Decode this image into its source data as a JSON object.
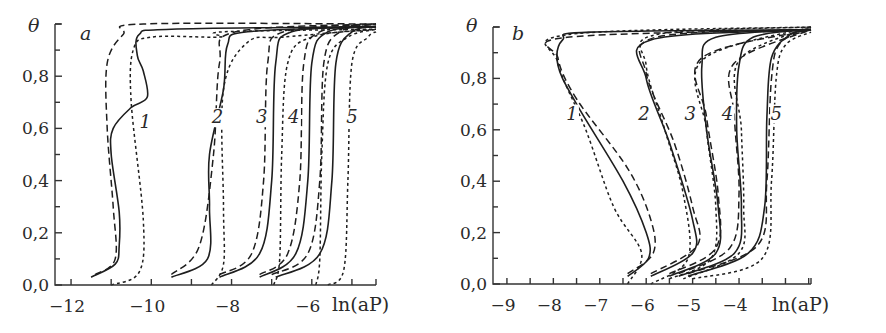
{
  "chart_data": [
    {
      "panel": "a",
      "type": "line",
      "title": "",
      "panel_label": "a",
      "xlabel": "ln(aP)",
      "ylabel": "θ",
      "xlim": [
        -12.4,
        -4.4
      ],
      "ylim": [
        0.0,
        1.0
      ],
      "x_ticks": [
        -12,
        -10,
        -8,
        -6
      ],
      "x_tick_labels": [
        "−12",
        "−10",
        "−8",
        "−6"
      ],
      "y_ticks": [
        0.0,
        0.2,
        0.4,
        0.6,
        0.8
      ],
      "y_tick_labels": [
        "0,0",
        "0,2",
        "0,4",
        "0,6",
        "0,8"
      ],
      "grid": false,
      "line_styles": [
        "solid",
        "dashed",
        "dotted"
      ],
      "curve_labels": [
        "1",
        "2",
        "3",
        "4",
        "5"
      ],
      "series": [
        {
          "curve": "1",
          "style": "solid",
          "points": [
            [
              -11.5,
              0.03
            ],
            [
              -10.9,
              0.08
            ],
            [
              -10.8,
              0.15
            ],
            [
              -10.8,
              0.28
            ],
            [
              -11.0,
              0.5
            ],
            [
              -10.95,
              0.6
            ],
            [
              -10.5,
              0.68
            ],
            [
              -10.1,
              0.72
            ],
            [
              -10.2,
              0.82
            ],
            [
              -10.35,
              0.88
            ],
            [
              -10.3,
              0.96
            ],
            [
              -9.5,
              0.98
            ],
            [
              -4.4,
              0.99
            ]
          ]
        },
        {
          "curve": "1",
          "style": "dashed",
          "points": [
            [
              -11.4,
              0.04
            ],
            [
              -10.9,
              0.1
            ],
            [
              -10.95,
              0.3
            ],
            [
              -11.1,
              0.6
            ],
            [
              -11.1,
              0.85
            ],
            [
              -10.7,
              0.96
            ],
            [
              -10.2,
              1.0
            ],
            [
              -4.4,
              1.0
            ]
          ]
        },
        {
          "curve": "1",
          "style": "dotted",
          "points": [
            [
              -11.0,
              0.0
            ],
            [
              -10.3,
              0.05
            ],
            [
              -10.2,
              0.25
            ],
            [
              -10.5,
              0.7
            ],
            [
              -10.45,
              0.9
            ],
            [
              -10.0,
              0.95
            ],
            [
              -8.3,
              0.95
            ],
            [
              -8.2,
              0.97
            ],
            [
              -4.4,
              0.98
            ]
          ]
        },
        {
          "curve": "2",
          "style": "solid",
          "points": [
            [
              -9.5,
              0.03
            ],
            [
              -8.6,
              0.1
            ],
            [
              -8.55,
              0.3
            ],
            [
              -8.55,
              0.5
            ],
            [
              -8.2,
              0.75
            ],
            [
              -8.1,
              0.92
            ],
            [
              -7.6,
              0.97
            ],
            [
              -4.4,
              0.99
            ]
          ]
        },
        {
          "curve": "2",
          "style": "dashed",
          "points": [
            [
              -9.5,
              0.04
            ],
            [
              -8.8,
              0.15
            ],
            [
              -8.45,
              0.5
            ],
            [
              -8.3,
              0.85
            ],
            [
              -7.9,
              0.97
            ],
            [
              -4.4,
              1.0
            ]
          ]
        },
        {
          "curve": "2",
          "style": "dotted",
          "points": [
            [
              -8.5,
              0.0
            ],
            [
              -8.2,
              0.08
            ],
            [
              -8.2,
              0.3
            ],
            [
              -8.2,
              0.75
            ],
            [
              -7.6,
              0.93
            ],
            [
              -6.7,
              0.95
            ],
            [
              -4.4,
              0.98
            ]
          ]
        },
        {
          "curve": "3",
          "style": "solid",
          "points": [
            [
              -8.3,
              0.03
            ],
            [
              -7.3,
              0.12
            ],
            [
              -7.0,
              0.4
            ],
            [
              -6.9,
              0.85
            ],
            [
              -6.5,
              0.97
            ],
            [
              -4.4,
              0.99
            ]
          ]
        },
        {
          "curve": "3",
          "style": "dashed",
          "points": [
            [
              -8.3,
              0.04
            ],
            [
              -7.5,
              0.12
            ],
            [
              -7.2,
              0.4
            ],
            [
              -7.1,
              0.85
            ],
            [
              -6.7,
              0.97
            ],
            [
              -4.4,
              1.0
            ]
          ]
        },
        {
          "curve": "3",
          "style": "dotted",
          "points": [
            [
              -6.95,
              0.0
            ],
            [
              -6.8,
              0.1
            ],
            [
              -6.75,
              0.5
            ],
            [
              -6.6,
              0.85
            ],
            [
              -6.0,
              0.95
            ],
            [
              -4.4,
              0.98
            ]
          ]
        },
        {
          "curve": "4",
          "style": "solid",
          "points": [
            [
              -7.3,
              0.03
            ],
            [
              -6.4,
              0.12
            ],
            [
              -6.1,
              0.4
            ],
            [
              -6.0,
              0.85
            ],
            [
              -5.6,
              0.97
            ],
            [
              -4.4,
              0.99
            ]
          ]
        },
        {
          "curve": "4",
          "style": "dashed",
          "points": [
            [
              -7.3,
              0.04
            ],
            [
              -6.6,
              0.12
            ],
            [
              -6.3,
              0.4
            ],
            [
              -6.2,
              0.85
            ],
            [
              -5.8,
              0.97
            ],
            [
              -4.4,
              1.0
            ]
          ]
        },
        {
          "curve": "4",
          "style": "dotted",
          "points": [
            [
              -5.9,
              0.0
            ],
            [
              -5.8,
              0.1
            ],
            [
              -5.75,
              0.5
            ],
            [
              -5.6,
              0.85
            ],
            [
              -5.1,
              0.95
            ],
            [
              -4.4,
              0.98
            ]
          ]
        },
        {
          "curve": "5",
          "style": "solid",
          "points": [
            [
              -6.9,
              0.03
            ],
            [
              -5.8,
              0.12
            ],
            [
              -5.5,
              0.4
            ],
            [
              -5.4,
              0.85
            ],
            [
              -5.0,
              0.97
            ],
            [
              -4.4,
              0.99
            ]
          ]
        },
        {
          "curve": "5",
          "style": "dashed",
          "points": [
            [
              -7.0,
              0.04
            ],
            [
              -6.1,
              0.12
            ],
            [
              -5.8,
              0.4
            ],
            [
              -5.7,
              0.85
            ],
            [
              -5.3,
              0.97
            ],
            [
              -4.4,
              1.0
            ]
          ]
        },
        {
          "curve": "5",
          "style": "dotted",
          "points": [
            [
              -5.6,
              0.0
            ],
            [
              -5.2,
              0.06
            ],
            [
              -5.1,
              0.4
            ],
            [
              -5.0,
              0.85
            ],
            [
              -4.6,
              0.95
            ],
            [
              -4.4,
              0.97
            ]
          ]
        }
      ]
    },
    {
      "panel": "b",
      "type": "line",
      "title": "",
      "panel_label": "b",
      "xlabel": "ln(aP)",
      "ylabel": "θ",
      "xlim": [
        -9.3,
        -2.45
      ],
      "ylim": [
        0.0,
        1.0
      ],
      "x_ticks": [
        -9,
        -8,
        -7,
        -6,
        -5,
        -4
      ],
      "x_tick_labels": [
        "−9",
        "−8",
        "−7",
        "−6",
        "−5",
        "−4"
      ],
      "y_ticks": [
        0.0,
        0.2,
        0.4,
        0.6,
        0.8
      ],
      "y_tick_labels": [
        "0,0",
        "0,2",
        "0,4",
        "0,6",
        "0,8"
      ],
      "grid": false,
      "line_styles": [
        "solid",
        "dashed",
        "dotted"
      ],
      "curve_labels": [
        "1",
        "2",
        "3",
        "4",
        "5"
      ],
      "series": [
        {
          "curve": "1",
          "style": "solid",
          "points": [
            [
              -6.4,
              0.03
            ],
            [
              -5.95,
              0.1
            ],
            [
              -6.0,
              0.2
            ],
            [
              -6.5,
              0.4
            ],
            [
              -7.5,
              0.7
            ],
            [
              -7.9,
              0.85
            ],
            [
              -7.8,
              0.95
            ],
            [
              -7.2,
              0.98
            ],
            [
              -2.45,
              0.99
            ]
          ]
        },
        {
          "curve": "1",
          "style": "dashed",
          "points": [
            [
              -6.4,
              0.04
            ],
            [
              -5.85,
              0.12
            ],
            [
              -5.9,
              0.25
            ],
            [
              -6.4,
              0.45
            ],
            [
              -7.5,
              0.72
            ],
            [
              -7.9,
              0.88
            ],
            [
              -7.7,
              0.96
            ],
            [
              -2.45,
              0.99
            ]
          ]
        },
        {
          "curve": "1",
          "style": "dotted",
          "points": [
            [
              -6.4,
              0.0
            ],
            [
              -6.1,
              0.12
            ],
            [
              -6.7,
              0.3
            ],
            [
              -7.3,
              0.6
            ],
            [
              -7.9,
              0.86
            ],
            [
              -7.7,
              0.97
            ],
            [
              -2.45,
              1.0
            ]
          ]
        },
        {
          "curve": "2",
          "style": "solid",
          "points": [
            [
              -5.9,
              0.03
            ],
            [
              -5.0,
              0.12
            ],
            [
              -5.0,
              0.25
            ],
            [
              -5.5,
              0.55
            ],
            [
              -6.0,
              0.8
            ],
            [
              -5.9,
              0.95
            ],
            [
              -2.45,
              0.99
            ]
          ]
        },
        {
          "curve": "2",
          "style": "dashed",
          "points": [
            [
              -5.9,
              0.04
            ],
            [
              -4.9,
              0.15
            ],
            [
              -5.0,
              0.3
            ],
            [
              -5.4,
              0.55
            ],
            [
              -6.0,
              0.82
            ],
            [
              -5.8,
              0.96
            ],
            [
              -2.45,
              0.99
            ]
          ]
        },
        {
          "curve": "2",
          "style": "dotted",
          "points": [
            [
              -5.9,
              0.0
            ],
            [
              -5.1,
              0.1
            ],
            [
              -5.2,
              0.35
            ],
            [
              -5.6,
              0.6
            ],
            [
              -6.0,
              0.85
            ],
            [
              -5.8,
              0.97
            ],
            [
              -2.45,
              1.0
            ]
          ]
        },
        {
          "curve": "3",
          "style": "solid",
          "points": [
            [
              -5.5,
              0.03
            ],
            [
              -4.5,
              0.12
            ],
            [
              -4.45,
              0.3
            ],
            [
              -4.7,
              0.6
            ],
            [
              -4.8,
              0.85
            ],
            [
              -4.5,
              0.96
            ],
            [
              -2.45,
              0.99
            ]
          ]
        },
        {
          "curve": "3",
          "style": "dashed",
          "points": [
            [
              -5.5,
              0.04
            ],
            [
              -4.5,
              0.14
            ],
            [
              -4.45,
              0.35
            ],
            [
              -4.7,
              0.65
            ],
            [
              -4.8,
              0.88
            ],
            [
              -2.45,
              0.99
            ]
          ]
        },
        {
          "curve": "3",
          "style": "dotted",
          "points": [
            [
              -5.5,
              0.02
            ],
            [
              -4.6,
              0.1
            ],
            [
              -4.5,
              0.3
            ],
            [
              -4.7,
              0.6
            ],
            [
              -4.8,
              0.87
            ],
            [
              -2.45,
              1.0
            ]
          ]
        },
        {
          "curve": "4",
          "style": "solid",
          "points": [
            [
              -5.3,
              0.03
            ],
            [
              -4.1,
              0.12
            ],
            [
              -3.95,
              0.3
            ],
            [
              -4.05,
              0.6
            ],
            [
              -4.0,
              0.85
            ],
            [
              -3.7,
              0.96
            ],
            [
              -2.45,
              0.99
            ]
          ]
        },
        {
          "curve": "4",
          "style": "dashed",
          "points": [
            [
              -5.3,
              0.04
            ],
            [
              -4.2,
              0.14
            ],
            [
              -4.0,
              0.35
            ],
            [
              -4.1,
              0.65
            ],
            [
              -4.1,
              0.86
            ],
            [
              -2.45,
              0.99
            ]
          ]
        },
        {
          "curve": "4",
          "style": "dotted",
          "points": [
            [
              -5.2,
              0.02
            ],
            [
              -4.0,
              0.12
            ],
            [
              -3.9,
              0.3
            ],
            [
              -3.95,
              0.6
            ],
            [
              -4.0,
              0.87
            ],
            [
              -2.45,
              1.0
            ]
          ]
        },
        {
          "curve": "5",
          "style": "solid",
          "points": [
            [
              -5.1,
              0.03
            ],
            [
              -3.8,
              0.12
            ],
            [
              -3.45,
              0.3
            ],
            [
              -3.4,
              0.65
            ],
            [
              -3.3,
              0.88
            ],
            [
              -2.9,
              0.97
            ],
            [
              -2.45,
              0.99
            ]
          ]
        },
        {
          "curve": "5",
          "style": "dashed",
          "points": [
            [
              -5.1,
              0.04
            ],
            [
              -3.6,
              0.15
            ],
            [
              -3.4,
              0.4
            ],
            [
              -3.3,
              0.8
            ],
            [
              -3.1,
              0.94
            ],
            [
              -2.45,
              0.99
            ]
          ]
        },
        {
          "curve": "5",
          "style": "dotted",
          "points": [
            [
              -5.0,
              0.02
            ],
            [
              -3.5,
              0.1
            ],
            [
              -3.3,
              0.4
            ],
            [
              -3.2,
              0.8
            ],
            [
              -3.0,
              0.93
            ],
            [
              -2.45,
              0.98
            ]
          ]
        }
      ]
    }
  ]
}
